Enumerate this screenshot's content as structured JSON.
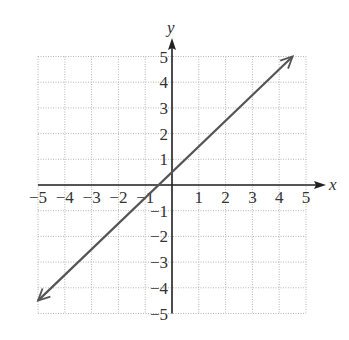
{
  "chart_data": {
    "type": "line",
    "title": "",
    "xlabel": "x",
    "ylabel": "y",
    "xlim": [
      -5,
      5
    ],
    "ylim": [
      -5,
      5
    ],
    "grid": true,
    "grid_style": "dotted",
    "x_ticks": [
      "-5",
      "-4",
      "-3",
      "-2",
      "-1",
      "1",
      "2",
      "3",
      "4",
      "5"
    ],
    "y_ticks": [
      "5",
      "4",
      "3",
      "2",
      "1",
      "-1",
      "-2",
      "-3",
      "-4",
      "-5"
    ],
    "series": [
      {
        "name": "line",
        "equation": "y = x + 0.5",
        "x": [
          -5.0,
          4.5
        ],
        "y": [
          -4.5,
          5.0
        ],
        "arrows": "both",
        "color": "#555555"
      }
    ]
  }
}
